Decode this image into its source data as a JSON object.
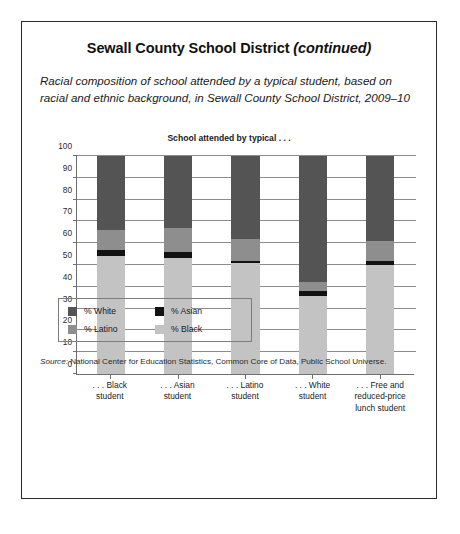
{
  "title": {
    "main": "Sewall County School District ",
    "continued": "(continued)"
  },
  "subtitle": "Racial composition of school attended by a typical student, based on racial and ethnic background, in Sewall County School District, 2009–10",
  "source": {
    "label": "Source:",
    "text": " National Center for Education Statistics, Common Core of Data, Public School Universe."
  },
  "chart_data": {
    "type": "bar",
    "stacked": true,
    "title": "School attended by typical . . .",
    "xlabel": "",
    "ylabel": "",
    "ylim": [
      0,
      100
    ],
    "yticks": [
      0,
      10,
      20,
      30,
      40,
      50,
      60,
      70,
      80,
      90,
      100
    ],
    "grid": true,
    "legend_position": "below-plot",
    "categories": [
      ". . . Black student",
      ". . . Asian student",
      ". . . Latino student",
      ". . . White student",
      ". . . Free and reduced-price lunch student"
    ],
    "category_lines": [
      [
        ". . . Black",
        "student"
      ],
      [
        ". . . Asian",
        "student"
      ],
      [
        ". . . Latino",
        "student"
      ],
      [
        ". . . White",
        "student"
      ],
      [
        ". . . Free and",
        "reduced-price",
        "lunch student"
      ]
    ],
    "series": [
      {
        "name": "% Black",
        "color": "#c3c3c3",
        "values": [
          54,
          53,
          51,
          36,
          50
        ]
      },
      {
        "name": "% Asian",
        "color": "#121212",
        "values": [
          3,
          3,
          1,
          2,
          2
        ]
      },
      {
        "name": "% Latino",
        "color": "#8e8e8e",
        "values": [
          9,
          11,
          10,
          4,
          9
        ]
      },
      {
        "name": "% White",
        "color": "#545454",
        "values": [
          34,
          33,
          38,
          58,
          39
        ]
      }
    ],
    "legend": [
      {
        "label": "% White",
        "color": "#545454"
      },
      {
        "label": "% Asian",
        "color": "#121212"
      },
      {
        "label": "% Latino",
        "color": "#8e8e8e"
      },
      {
        "label": "% Black",
        "color": "#c3c3c3"
      }
    ]
  }
}
